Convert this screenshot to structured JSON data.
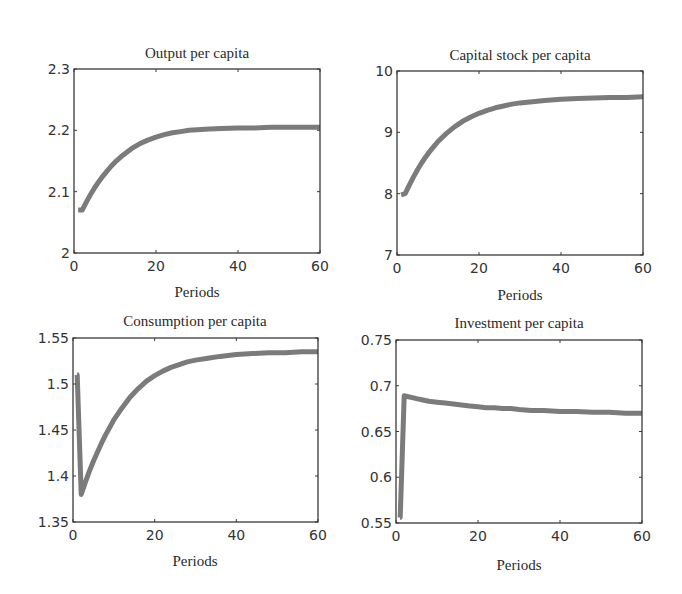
{
  "figure": {
    "line_color": "#7b7b7b",
    "axis_color": "#3a3a3a",
    "background": "#ffffff"
  },
  "chart_data": [
    {
      "type": "line",
      "title": "Output per capita",
      "xlabel": "Periods",
      "ylabel": "",
      "xlim": [
        0,
        60
      ],
      "ylim": [
        2.0,
        2.3
      ],
      "xticks": [
        0,
        20,
        40,
        60
      ],
      "yticks": [
        2.0,
        2.1,
        2.2,
        2.3
      ],
      "xtick_labels": [
        "0",
        "20",
        "40",
        "60"
      ],
      "ytick_labels": [
        "2",
        "2.1",
        "2.2",
        "2.3"
      ],
      "grid": false,
      "box": {
        "x0": 74,
        "y0": 69,
        "x1": 320,
        "y1": 253
      },
      "series": [
        {
          "name": "Output per capita",
          "x": [
            1,
            2,
            3,
            4,
            5,
            6,
            7,
            8,
            9,
            10,
            12,
            14,
            16,
            18,
            20,
            22,
            24,
            26,
            28,
            30,
            33,
            36,
            40,
            44,
            48,
            52,
            56,
            60
          ],
          "values": [
            2.07,
            2.07,
            2.083,
            2.095,
            2.106,
            2.116,
            2.125,
            2.133,
            2.141,
            2.148,
            2.16,
            2.17,
            2.178,
            2.184,
            2.189,
            2.193,
            2.196,
            2.198,
            2.2,
            2.201,
            2.202,
            2.203,
            2.204,
            2.204,
            2.205,
            2.205,
            2.205,
            2.205
          ]
        }
      ]
    },
    {
      "type": "line",
      "title": "Capital stock per capita",
      "xlabel": "Periods",
      "ylabel": "",
      "xlim": [
        0,
        60
      ],
      "ylim": [
        7,
        10
      ],
      "xticks": [
        0,
        20,
        40,
        60
      ],
      "yticks": [
        7,
        8,
        9,
        10
      ],
      "xtick_labels": [
        "0",
        "20",
        "40",
        "60"
      ],
      "ytick_labels": [
        "7",
        "8",
        "9",
        "10"
      ],
      "grid": false,
      "box": {
        "x0": 397,
        "y0": 71,
        "x1": 643,
        "y1": 255
      },
      "series": [
        {
          "name": "Capital stock per capita",
          "x": [
            1,
            2,
            3,
            4,
            5,
            6,
            7,
            8,
            9,
            10,
            12,
            14,
            16,
            18,
            20,
            22,
            24,
            26,
            28,
            30,
            33,
            36,
            40,
            44,
            48,
            52,
            56,
            60
          ],
          "values": [
            7.98,
            8.0,
            8.14,
            8.27,
            8.39,
            8.5,
            8.6,
            8.69,
            8.77,
            8.85,
            8.98,
            9.09,
            9.18,
            9.25,
            9.31,
            9.36,
            9.4,
            9.43,
            9.46,
            9.48,
            9.5,
            9.52,
            9.54,
            9.55,
            9.56,
            9.57,
            9.57,
            9.58
          ]
        }
      ]
    },
    {
      "type": "line",
      "title": "Consumption per capita",
      "xlabel": "Periods",
      "ylabel": "",
      "xlim": [
        0,
        60
      ],
      "ylim": [
        1.35,
        1.55
      ],
      "xticks": [
        0,
        20,
        40,
        60
      ],
      "yticks": [
        1.35,
        1.4,
        1.45,
        1.5,
        1.55
      ],
      "xtick_labels": [
        "0",
        "20",
        "40",
        "60"
      ],
      "ytick_labels": [
        "1.35",
        "1.4",
        "1.45",
        "1.5",
        "1.55"
      ],
      "grid": false,
      "box": {
        "x0": 73,
        "y0": 338,
        "x1": 318,
        "y1": 522
      },
      "series": [
        {
          "name": "Consumption per capita",
          "x": [
            1,
            1.02,
            2,
            3,
            4,
            5,
            6,
            7,
            8,
            9,
            10,
            12,
            14,
            16,
            18,
            20,
            22,
            24,
            26,
            28,
            30,
            33,
            36,
            40,
            44,
            48,
            52,
            56,
            60
          ],
          "values": [
            1.51,
            1.51,
            1.38,
            1.393,
            1.405,
            1.416,
            1.426,
            1.436,
            1.445,
            1.453,
            1.461,
            1.474,
            1.486,
            1.495,
            1.503,
            1.509,
            1.514,
            1.518,
            1.521,
            1.524,
            1.526,
            1.528,
            1.53,
            1.532,
            1.533,
            1.534,
            1.534,
            1.535,
            1.535
          ]
        }
      ]
    },
    {
      "type": "line",
      "title": "Investment per capita",
      "xlabel": "Periods",
      "ylabel": "",
      "xlim": [
        0,
        60
      ],
      "ylim": [
        0.55,
        0.75
      ],
      "xticks": [
        0,
        20,
        40,
        60
      ],
      "yticks": [
        0.55,
        0.6,
        0.65,
        0.7,
        0.75
      ],
      "xtick_labels": [
        "0",
        "20",
        "40",
        "60"
      ],
      "ytick_labels": [
        "0.55",
        "0.6",
        "0.65",
        "0.7",
        "0.75"
      ],
      "grid": false,
      "box": {
        "x0": 396,
        "y0": 340,
        "x1": 642,
        "y1": 523
      },
      "series": [
        {
          "name": "Investment per capita",
          "x": [
            1,
            1.02,
            2,
            3,
            4,
            5,
            6,
            8,
            10,
            12,
            14,
            16,
            18,
            20,
            22,
            24,
            26,
            28,
            30,
            33,
            36,
            40,
            44,
            48,
            52,
            56,
            60
          ],
          "values": [
            0.556,
            0.556,
            0.689,
            0.688,
            0.687,
            0.686,
            0.685,
            0.683,
            0.682,
            0.681,
            0.68,
            0.679,
            0.678,
            0.677,
            0.676,
            0.676,
            0.675,
            0.675,
            0.674,
            0.673,
            0.673,
            0.672,
            0.672,
            0.671,
            0.671,
            0.67,
            0.67
          ]
        }
      ]
    }
  ]
}
